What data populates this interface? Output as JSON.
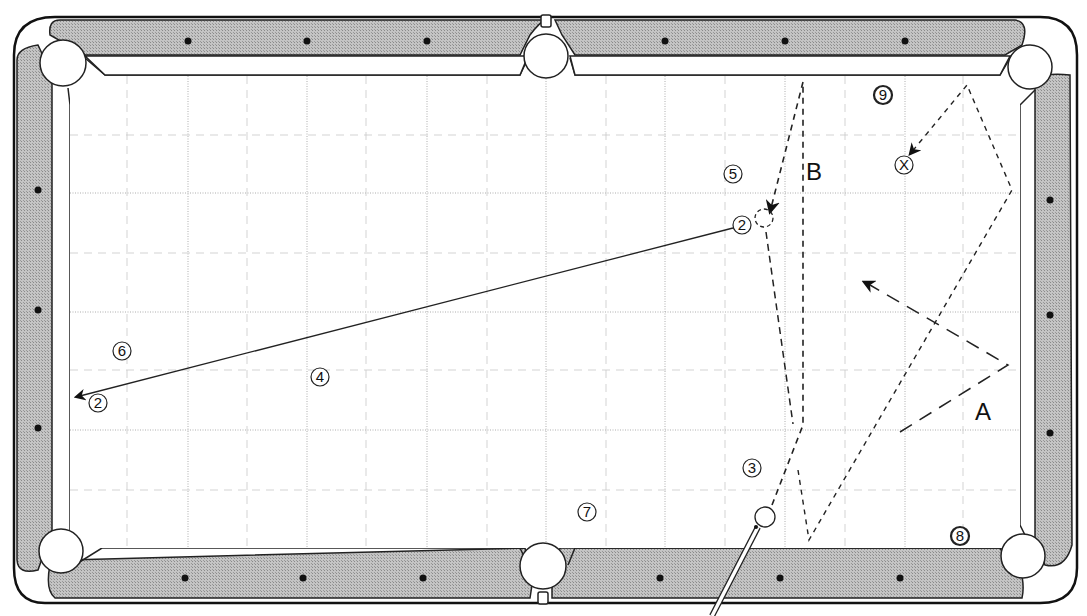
{
  "diagram": {
    "type": "billiards-table-shot-diagram",
    "colors": {
      "rail": "#b8b8b8",
      "outline": "#222222",
      "felt": "#ffffff",
      "grid": "#a8a8a8",
      "path": "#222222"
    },
    "labels": {
      "A": "A",
      "B": "B"
    },
    "balls": [
      {
        "id": "ball-2-object",
        "label": "2",
        "x": 742,
        "y": 225
      },
      {
        "id": "ball-2-pocketed",
        "label": "2",
        "x": 98,
        "y": 403
      },
      {
        "id": "ball-3",
        "label": "3",
        "x": 752,
        "y": 468
      },
      {
        "id": "ball-4",
        "label": "4",
        "x": 320,
        "y": 377
      },
      {
        "id": "ball-5",
        "label": "5",
        "x": 733,
        "y": 174
      },
      {
        "id": "ball-6",
        "label": "6",
        "x": 122,
        "y": 351
      },
      {
        "id": "ball-7",
        "label": "7",
        "x": 587,
        "y": 512
      },
      {
        "id": "ball-8",
        "label": "8",
        "x": 960,
        "y": 536
      },
      {
        "id": "ball-9",
        "label": "9",
        "x": 883,
        "y": 95
      },
      {
        "id": "target-x",
        "label": "X",
        "x": 904,
        "y": 165
      }
    ],
    "cue_ball": {
      "x": 765,
      "y": 517
    },
    "rail_diamonds": {
      "top": [
        188,
        307,
        427,
        665,
        785,
        905
      ],
      "bottom": [
        185,
        303,
        423,
        660,
        780,
        900
      ],
      "left": [
        190,
        310,
        428
      ],
      "right": [
        200,
        315,
        433
      ]
    }
  }
}
